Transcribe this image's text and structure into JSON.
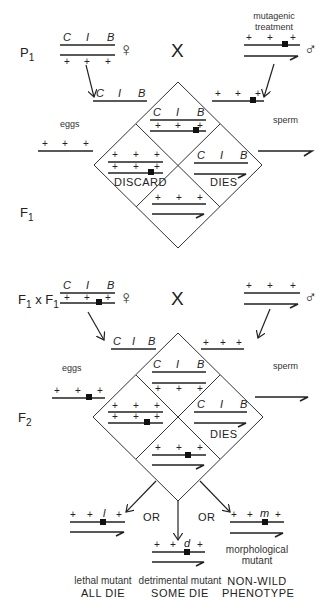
{
  "diagram": {
    "type": "Muller ClB genetic screen for X-linked mutations",
    "top_cross": {
      "generation_label": "P",
      "generation_sub": "1",
      "cross_symbol": "X",
      "female_symbol": "♀",
      "male_symbol": "♂",
      "male_note_line1": "mutagenic",
      "male_note_line2": "treatment",
      "female_chrom_top": [
        "C",
        "I",
        "B"
      ],
      "female_chrom_bottom": [
        "+",
        "+",
        "+"
      ],
      "male_chrom_top": [
        "+",
        "+",
        "+"
      ],
      "egg_chrom": [
        "C",
        "I",
        "B"
      ],
      "egg_label": "eggs",
      "egg_chrom2": [
        "+",
        "+",
        "+"
      ],
      "sperm_chrom": [
        "+",
        "+",
        "+"
      ],
      "sperm_label": "sperm",
      "offspring_generation": "F",
      "offspring_sub": "1",
      "cells": {
        "top": {
          "top": [
            "C",
            "I",
            "B"
          ],
          "bottom": [
            "+",
            "+",
            "+"
          ]
        },
        "left": {
          "top": [
            "+",
            "+",
            "+"
          ],
          "bottom": [
            "+",
            "+",
            "+"
          ],
          "label": "DISCARD"
        },
        "right": {
          "top": [
            "C",
            "I",
            "B"
          ],
          "label": "DIES"
        },
        "bottom": {
          "top": [
            "+",
            "+",
            "+"
          ]
        }
      }
    },
    "bottom_cross": {
      "generation_label_a": "F",
      "generation_sub_a": "1",
      "cross_x": "x",
      "generation_label_b": "F",
      "generation_sub_b": "1",
      "cross_symbol": "X",
      "female_symbol": "♀",
      "male_symbol": "♂",
      "female_chrom_top": [
        "C",
        "I",
        "B"
      ],
      "female_chrom_bottom": [
        "+",
        "+",
        "+"
      ],
      "male_chrom_top": [
        "+",
        "+",
        "+"
      ],
      "egg_chrom": [
        "C",
        "I",
        "B"
      ],
      "egg_label": "eggs",
      "egg_chrom2": [
        "+",
        "+",
        "+"
      ],
      "sperm_chrom": [
        "+",
        "+",
        "+"
      ],
      "sperm_label": "sperm",
      "offspring_generation": "F",
      "offspring_sub": "2",
      "cells": {
        "top": {
          "top": [
            "C",
            "I",
            "B"
          ],
          "bottom": [
            "+",
            "+",
            "+"
          ]
        },
        "left": {
          "top": [
            "+",
            "+",
            "+"
          ],
          "bottom": [
            "+",
            "+",
            "+"
          ]
        },
        "right": {
          "top": [
            "C",
            "I",
            "B"
          ],
          "label": "DIES"
        },
        "bottom": {
          "top": [
            "+",
            "+",
            "+"
          ]
        }
      }
    },
    "outcomes": {
      "or_label": "OR",
      "lethal": {
        "genes": [
          "+",
          "+",
          "l",
          "+"
        ],
        "line1": "lethal mutant",
        "line2": "ALL DIE"
      },
      "detrimental": {
        "genes": [
          "+",
          "+",
          "d",
          "+"
        ],
        "line1": "detrimental mutant",
        "line2": "SOME DIE"
      },
      "morphological": {
        "genes": [
          "+",
          "+",
          "m",
          "+"
        ],
        "note1": "morphological",
        "note2": "mutant",
        "line1": "NON-WILD",
        "line2": "PHENOTYPE"
      }
    }
  }
}
